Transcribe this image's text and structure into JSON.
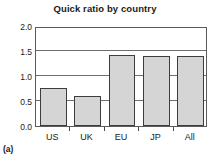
{
  "panel": {
    "label": "(a)"
  },
  "chart_data": {
    "type": "bar",
    "title": "Quick ratio by country",
    "xlabel": "",
    "ylabel": "",
    "categories": [
      "US",
      "UK",
      "EU",
      "JP",
      "All"
    ],
    "values": [
      0.77,
      0.6,
      1.42,
      1.41,
      1.41
    ],
    "ylim": [
      0.0,
      2.0
    ],
    "yticks": [
      0.0,
      0.5,
      1.0,
      1.5,
      2.0
    ],
    "ytick_labels": [
      "0.0",
      "0.5",
      "1.0",
      "1.5",
      "2.0"
    ],
    "grid": true,
    "grid_axis": "y",
    "legend": false,
    "legend_position": "none",
    "bar_fill_color": "#d5d5d5",
    "bar_edge_color": "#3d3d3d",
    "plot_background": "#ffffff",
    "frame_color": "#5a5a5a"
  }
}
